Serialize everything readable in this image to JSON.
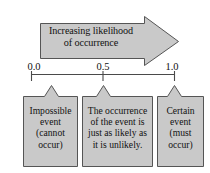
{
  "figure": {
    "colors": {
      "shape_fill": "#c9c9c9",
      "shape_stroke": "#555555",
      "axis_line": "#4a4a4a",
      "text": "#111111",
      "background": "#ffffff"
    }
  },
  "arrow": {
    "caption": "Increasing likelihood\nof occurrence",
    "direction": "right"
  },
  "axis": {
    "ticks": [
      {
        "value": "0.0",
        "position": 0.0
      },
      {
        "value": "0.5",
        "position": 0.5
      },
      {
        "value": "1.0",
        "position": 1.0
      }
    ]
  },
  "boxes": [
    {
      "id": "impossible",
      "text": "Impossible\nevent\n(cannot\noccur)",
      "tick": "0.0"
    },
    {
      "id": "even-chance",
      "text": "The occurrence\nof the event is\njust as likely as\nit is unlikely.",
      "tick": "0.5"
    },
    {
      "id": "certain",
      "text": "Certain\nevent\n(must\noccur)",
      "tick": "1.0"
    }
  ]
}
